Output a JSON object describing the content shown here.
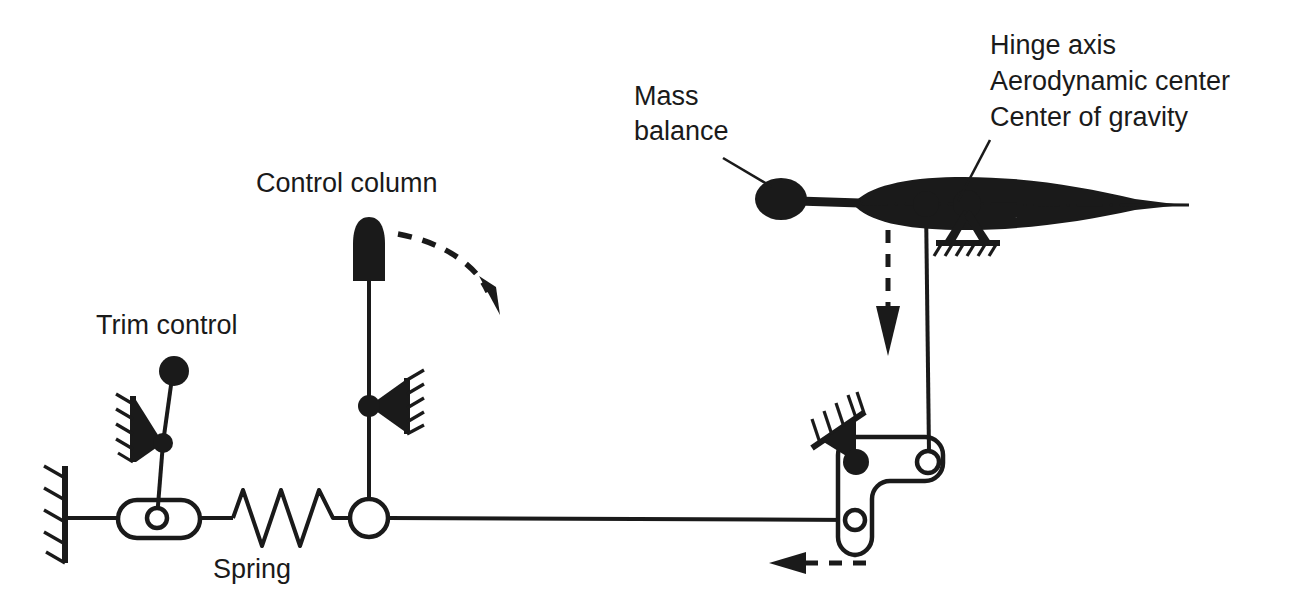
{
  "figure": {
    "background_color": "#ffffff",
    "line_color": "#1a1a1a"
  },
  "labels": {
    "trim_control": "Trim control",
    "control_column": "Control column",
    "spring": "Spring",
    "mass_balance_line1": "Mass",
    "mass_balance_line2": "balance",
    "hinge_axis": "Hinge axis",
    "aerodynamic_center": "Aerodynamic center",
    "center_of_gravity": "Center of gravity"
  },
  "components": {
    "ground_wall_left": "fixed-ground-hatching",
    "trim_slot_link": "slotted-trim-link",
    "trim_lever_knob": "trim-lever-knob",
    "trim_pivot_bracket": "wall-pivot-bracket",
    "spring_coil": "zigzag-spring",
    "control_column_handle": "control-column-grip",
    "control_column_pivot": "control-column-pivot-bracket",
    "control_rod_joint": "control-rod-open-joint",
    "push_rod_horizontal": "long-horizontal-push-rod",
    "bellcrank": "bellcrank-lever",
    "bellcrank_pivot": "bellcrank-ground-pivot",
    "push_rod_vertical": "vertical-push-rod",
    "airfoil": "control-surface-airfoil",
    "mass_balance_weight": "mass-balance-weight",
    "hinge_support": "hinge-ground-support",
    "chord_centerline": "airfoil-chord-centerline"
  },
  "annotations": {
    "column_motion_arrow": "curved-dashed-arrow-clockwise",
    "surface_motion_arrow": "dashed-arrow-down",
    "rod_motion_arrow": "dashed-arrow-left"
  }
}
